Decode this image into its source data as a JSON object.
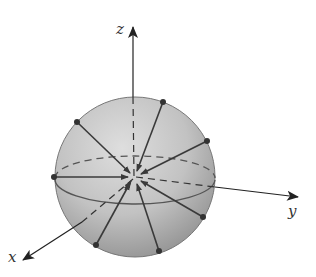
{
  "diagram": {
    "type": "sphere-with-inward-vectors",
    "axes": {
      "x": {
        "label": "x"
      },
      "y": {
        "label": "y"
      },
      "z": {
        "label": "z"
      }
    },
    "sphere": {
      "cx": 135,
      "cy": 177,
      "r": 80,
      "fill_light": "#d9d9d9",
      "fill_dark": "#9a9a9a",
      "stroke": "#6e6e6e"
    },
    "surface_points": [
      {
        "x": 77,
        "y": 122
      },
      {
        "x": 163,
        "y": 102
      },
      {
        "x": 207,
        "y": 141
      },
      {
        "x": 54,
        "y": 177
      },
      {
        "x": 203,
        "y": 217
      },
      {
        "x": 96,
        "y": 245
      },
      {
        "x": 159,
        "y": 251
      }
    ],
    "arrow_color": "#3a3a3a"
  }
}
